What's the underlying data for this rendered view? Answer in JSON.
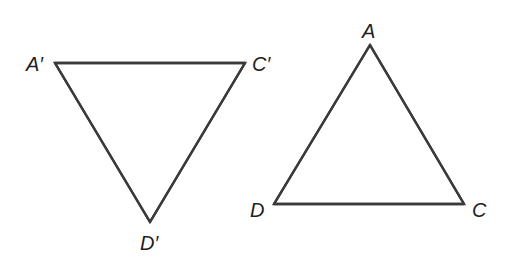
{
  "diagram": {
    "type": "geometry-triangles",
    "stroke_color": "#3a3a3a",
    "label_color": "#1e1e1e",
    "triangles": [
      {
        "name": "A'C'D'",
        "vertices": [
          {
            "id": "A1",
            "label": "A′"
          },
          {
            "id": "C1",
            "label": "C′"
          },
          {
            "id": "D1",
            "label": "D′"
          }
        ],
        "edges": [
          [
            "A1",
            "C1"
          ],
          [
            "C1",
            "D1"
          ],
          [
            "D1",
            "A1"
          ]
        ]
      },
      {
        "name": "ADC",
        "vertices": [
          {
            "id": "A",
            "label": "A"
          },
          {
            "id": "D",
            "label": "D"
          },
          {
            "id": "C",
            "label": "C"
          }
        ],
        "edges": [
          [
            "A",
            "C"
          ],
          [
            "C",
            "D"
          ],
          [
            "D",
            "A"
          ]
        ]
      }
    ]
  }
}
